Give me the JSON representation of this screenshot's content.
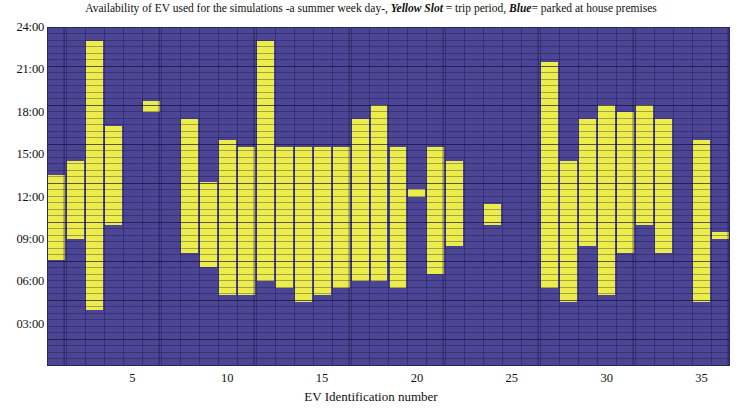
{
  "title": {
    "part1": "Availability of EV used for the simulations -a summer week day-, ",
    "em1": "Yellow Slot",
    "part2": " = trip period, ",
    "em2": "Blue",
    "part3": "= parked at house premises"
  },
  "colors": {
    "trip": "#ecec4a",
    "parked": "#4b4593",
    "grid": "#2a2461",
    "text": "#111111"
  },
  "axes": {
    "xlabel": "EV Identification number",
    "ylabel": "",
    "xticks": [
      "5",
      "10",
      "15",
      "20",
      "25",
      "30",
      "35"
    ],
    "yticks": [
      "03:00",
      "06:00",
      "09:00",
      "12:00",
      "15:00",
      "18:00",
      "21:00",
      "24:00"
    ]
  },
  "chart_data": {
    "type": "heatmap",
    "title": "Availability of EV used for the simulations -a summer week day-, Yellow Slot = trip period, Blue= parked at house premises",
    "xlabel": "EV Identification number",
    "ylabel": "Time of day",
    "xlim": [
      0.5,
      36.5
    ],
    "ylim": [
      0,
      24
    ],
    "grid": true,
    "legend": [
      {
        "name": "Yellow Slot",
        "color": "#ecec4a",
        "meaning": "trip period"
      },
      {
        "name": "Blue",
        "color": "#4b4593",
        "meaning": "parked at house premises"
      }
    ],
    "x_tick_values": [
      5,
      10,
      15,
      20,
      25,
      30,
      35
    ],
    "y_tick_values": [
      3,
      6,
      9,
      12,
      15,
      18,
      21,
      24
    ],
    "y_tick_labels": [
      "03:00",
      "06:00",
      "09:00",
      "12:00",
      "15:00",
      "18:00",
      "21:00",
      "24:00"
    ],
    "categories": [
      1,
      2,
      3,
      4,
      5,
      6,
      7,
      8,
      9,
      10,
      11,
      12,
      13,
      14,
      15,
      16,
      17,
      18,
      19,
      20,
      21,
      22,
      23,
      24,
      25,
      26,
      27,
      28,
      29,
      30,
      31,
      32,
      33,
      34,
      35,
      36
    ],
    "series_name": "trip period (yellow) intervals, hours",
    "trip_intervals": [
      {
        "ev": 1,
        "spans": [
          [
            7.5,
            13.5
          ]
        ]
      },
      {
        "ev": 2,
        "spans": [
          [
            9.0,
            14.5
          ]
        ]
      },
      {
        "ev": 3,
        "spans": [
          [
            4.0,
            23.0
          ]
        ]
      },
      {
        "ev": 4,
        "spans": [
          [
            10.0,
            17.0
          ]
        ]
      },
      {
        "ev": 5,
        "spans": []
      },
      {
        "ev": 6,
        "spans": [
          [
            18.0,
            18.75
          ]
        ]
      },
      {
        "ev": 7,
        "spans": []
      },
      {
        "ev": 8,
        "spans": [
          [
            8.0,
            17.5
          ]
        ]
      },
      {
        "ev": 9,
        "spans": [
          [
            7.0,
            13.0
          ]
        ]
      },
      {
        "ev": 10,
        "spans": [
          [
            5.0,
            16.0
          ]
        ]
      },
      {
        "ev": 11,
        "spans": [
          [
            5.0,
            15.5
          ]
        ]
      },
      {
        "ev": 12,
        "spans": [
          [
            6.0,
            23.0
          ]
        ]
      },
      {
        "ev": 13,
        "spans": [
          [
            5.5,
            15.5
          ]
        ]
      },
      {
        "ev": 14,
        "spans": [
          [
            4.5,
            15.5
          ]
        ]
      },
      {
        "ev": 15,
        "spans": [
          [
            5.0,
            15.5
          ]
        ]
      },
      {
        "ev": 16,
        "spans": [
          [
            5.5,
            15.5
          ]
        ]
      },
      {
        "ev": 17,
        "spans": [
          [
            6.0,
            17.5
          ]
        ]
      },
      {
        "ev": 18,
        "spans": [
          [
            6.0,
            18.5
          ]
        ]
      },
      {
        "ev": 19,
        "spans": [
          [
            5.5,
            15.5
          ]
        ]
      },
      {
        "ev": 20,
        "spans": [
          [
            12.0,
            12.5
          ]
        ]
      },
      {
        "ev": 21,
        "spans": [
          [
            6.5,
            15.5
          ]
        ]
      },
      {
        "ev": 22,
        "spans": [
          [
            8.5,
            14.5
          ]
        ]
      },
      {
        "ev": 23,
        "spans": []
      },
      {
        "ev": 24,
        "spans": [
          [
            10.0,
            11.5
          ]
        ]
      },
      {
        "ev": 25,
        "spans": []
      },
      {
        "ev": 26,
        "spans": []
      },
      {
        "ev": 27,
        "spans": [
          [
            5.5,
            21.5
          ]
        ]
      },
      {
        "ev": 28,
        "spans": [
          [
            4.5,
            14.5
          ]
        ]
      },
      {
        "ev": 29,
        "spans": [
          [
            8.5,
            17.5
          ]
        ]
      },
      {
        "ev": 30,
        "spans": [
          [
            5.0,
            18.5
          ]
        ]
      },
      {
        "ev": 31,
        "spans": [
          [
            8.0,
            18.0
          ]
        ]
      },
      {
        "ev": 32,
        "spans": [
          [
            10.0,
            18.5
          ]
        ]
      },
      {
        "ev": 33,
        "spans": [
          [
            8.0,
            17.5
          ]
        ]
      },
      {
        "ev": 34,
        "spans": []
      },
      {
        "ev": 35,
        "spans": [
          [
            4.5,
            16.0
          ]
        ]
      },
      {
        "ev": 36,
        "spans": [
          [
            9.0,
            9.5
          ]
        ]
      }
    ]
  }
}
